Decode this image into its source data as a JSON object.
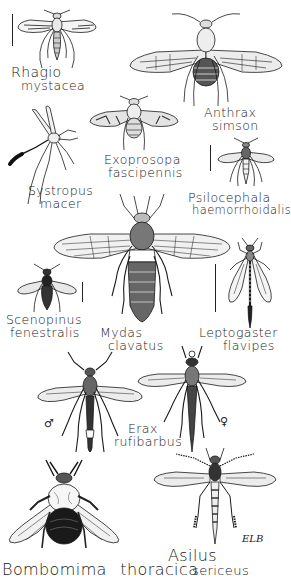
{
  "plate": {
    "style": "black-and-white line illustration of flies (Diptera: Brachycera)",
    "colors": {
      "ink": "#1a1a1a",
      "paper": "#ffffff"
    },
    "specimens": [
      {
        "id": "rhagio",
        "genus": "Rhagio",
        "species": "mystacea"
      },
      {
        "id": "anthrax",
        "genus": "Anthrax",
        "species": "simson"
      },
      {
        "id": "systropus",
        "genus": "Systropus",
        "species": "macer"
      },
      {
        "id": "exoprosopa",
        "genus": "Exoprosopa",
        "species": "fascipennis"
      },
      {
        "id": "psilocephala",
        "genus": "Psilocephala",
        "species": "haemorrhoidalis"
      },
      {
        "id": "scenopinus",
        "genus": "Scenopinus",
        "species": "fenestralis"
      },
      {
        "id": "mydas",
        "genus": "Mydas",
        "species": "clavatus"
      },
      {
        "id": "leptogaster",
        "genus": "Leptogaster",
        "species": "flavipes"
      },
      {
        "id": "erax",
        "genus": "Erax",
        "species": "rufibarbus",
        "male_symbol": "♂",
        "female_symbol": "♀"
      },
      {
        "id": "bombomima",
        "genus": "Bombomima",
        "species": "thoracica"
      },
      {
        "id": "asilus",
        "genus": "Asilus",
        "species": "sericeus"
      }
    ],
    "signature": "ELB"
  }
}
